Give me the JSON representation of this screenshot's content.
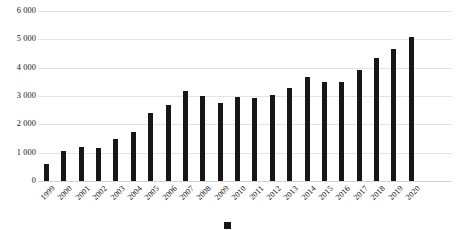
{
  "chart_data": {
    "type": "bar",
    "title": "",
    "subtitle": "",
    "xlabel": "",
    "ylabel": "",
    "ylim": [
      0,
      6000
    ],
    "yticks": [
      0,
      1000,
      2000,
      3000,
      4000,
      5000,
      6000
    ],
    "ytick_labels": [
      "0",
      "1 000",
      "2 000",
      "3 000",
      "4 000",
      "5 000",
      "6 000"
    ],
    "grid": true,
    "legend": "none",
    "bar_color": "#171717",
    "categories": [
      "1999",
      "2000",
      "2001",
      "2002",
      "2003",
      "2004",
      "2005",
      "2006",
      "2007",
      "2008",
      "2009",
      "2010",
      "2011",
      "2012",
      "2013",
      "2014",
      "2015",
      "2016",
      "2017",
      "2018",
      "2019",
      "2020"
    ],
    "values": [
      600,
      1070,
      1210,
      1180,
      1500,
      1740,
      2400,
      2680,
      3190,
      2990,
      2760,
      2980,
      2930,
      3030,
      3280,
      3680,
      3480,
      3510,
      3930,
      4330,
      4650,
      5080
    ]
  },
  "caption": {
    "marker": "",
    "text": ""
  }
}
